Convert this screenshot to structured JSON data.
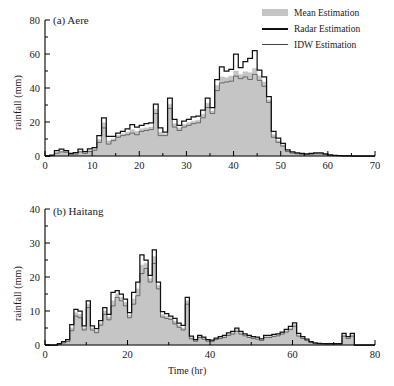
{
  "figure": {
    "background": "#ffffff",
    "fill_color": "#c5c5c5",
    "radar_color": "#111111",
    "idw_color": "#444444"
  },
  "legend": {
    "position": "top-right",
    "entries": [
      {
        "label": "Mean Estimation",
        "mark": "fill-swatch"
      },
      {
        "label": "Radar Estimation",
        "mark": "thick-line"
      },
      {
        "label": "IDW Estimation",
        "mark": "thin-line"
      }
    ]
  },
  "chart_data": [
    {
      "type": "area",
      "panel": "a",
      "title": "(a) Aere",
      "xlabel": "",
      "ylabel": "rainfall (mm)",
      "xlim": [
        0,
        70
      ],
      "ylim": [
        0,
        80
      ],
      "xticks": [
        0,
        10,
        20,
        30,
        40,
        50,
        60,
        70
      ],
      "yticks": [
        0,
        20,
        40,
        60,
        80
      ],
      "xminor_step": 5,
      "yminor_step": 10,
      "grid": false,
      "x": [
        0,
        1,
        2,
        3,
        4,
        5,
        6,
        7,
        8,
        9,
        10,
        11,
        12,
        13,
        14,
        15,
        16,
        17,
        18,
        19,
        20,
        21,
        22,
        23,
        24,
        25,
        26,
        27,
        28,
        29,
        30,
        31,
        32,
        33,
        34,
        35,
        36,
        37,
        38,
        39,
        40,
        41,
        42,
        43,
        44,
        45,
        46,
        47,
        48,
        49,
        50,
        51,
        52,
        53,
        54,
        55,
        56,
        57,
        58,
        59,
        60,
        61,
        62,
        63,
        64,
        65,
        66,
        67,
        68,
        69,
        70
      ],
      "series": [
        {
          "name": "Mean Estimation",
          "values": [
            0,
            0.3,
            2.2,
            3.0,
            2.6,
            1.2,
            1.5,
            3.0,
            2.0,
            3.3,
            4.2,
            9.6,
            19.5,
            9.0,
            10.0,
            12.0,
            13.0,
            14.0,
            15.5,
            14.5,
            16.0,
            16.5,
            17.0,
            27.5,
            14.0,
            13.0,
            30.5,
            19.0,
            16.5,
            18.5,
            19.5,
            20.5,
            21.0,
            24.5,
            31.0,
            26.5,
            41.5,
            46.5,
            46.0,
            47.0,
            50.0,
            48.0,
            49.5,
            49.0,
            51.5,
            47.0,
            43.5,
            33.0,
            12.5,
            9.0,
            6.5,
            3.0,
            2.0,
            1.5,
            1.2,
            1.0,
            1.2,
            1.5,
            1.5,
            1.0,
            0.5,
            0.3,
            0.2,
            0.1,
            0.1,
            0,
            0,
            0,
            0,
            0,
            0
          ]
        },
        {
          "name": "Radar Estimation",
          "values": [
            0,
            0.5,
            3.2,
            4.0,
            3.2,
            1.6,
            2.0,
            4.0,
            2.6,
            4.2,
            5.0,
            12.0,
            22.5,
            11.5,
            11.5,
            13.5,
            14.5,
            16.0,
            18.5,
            17.0,
            18.0,
            19.0,
            19.5,
            30.5,
            16.5,
            14.0,
            34.0,
            21.5,
            18.0,
            20.5,
            21.5,
            23.0,
            23.5,
            27.0,
            34.0,
            28.5,
            45.0,
            52.5,
            50.0,
            51.0,
            60.0,
            52.0,
            55.5,
            57.5,
            62.0,
            50.5,
            46.5,
            35.0,
            14.5,
            10.5,
            7.5,
            3.6,
            2.4,
            1.8,
            1.5,
            1.2,
            1.5,
            1.8,
            1.8,
            1.2,
            0.6,
            0.4,
            0.2,
            0.1,
            0.1,
            0,
            0,
            0,
            0,
            0,
            0
          ]
        },
        {
          "name": "IDW Estimation",
          "values": [
            0,
            0.2,
            1.6,
            2.4,
            2.2,
            0.9,
            1.1,
            2.4,
            1.5,
            2.6,
            3.4,
            8.0,
            16.5,
            7.0,
            9.0,
            11.0,
            12.0,
            12.5,
            13.5,
            12.5,
            14.5,
            15.0,
            15.5,
            25.0,
            12.0,
            12.0,
            28.0,
            17.0,
            15.0,
            17.0,
            18.0,
            19.0,
            19.5,
            22.5,
            28.5,
            25.0,
            38.5,
            43.0,
            43.5,
            44.0,
            47.0,
            45.5,
            46.5,
            45.0,
            48.0,
            44.5,
            41.0,
            31.5,
            11.0,
            8.0,
            5.8,
            2.6,
            1.7,
            1.3,
            1.0,
            0.9,
            1.0,
            1.3,
            1.3,
            0.9,
            0.4,
            0.2,
            0.2,
            0.1,
            0.1,
            0,
            0,
            0,
            0,
            0,
            0
          ]
        }
      ]
    },
    {
      "type": "area",
      "panel": "b",
      "title": "(b) Haitang",
      "xlabel": "Time (hr)",
      "ylabel": "rainfall (mm)",
      "xlim": [
        0,
        80
      ],
      "ylim": [
        0,
        40
      ],
      "xticks": [
        0,
        20,
        40,
        60,
        80
      ],
      "yticks": [
        0,
        10,
        20,
        30,
        40
      ],
      "xminor_step": 10,
      "yminor_step": 5,
      "grid": false,
      "x": [
        0,
        1,
        2,
        3,
        4,
        5,
        6,
        7,
        8,
        9,
        10,
        11,
        12,
        13,
        14,
        15,
        16,
        17,
        18,
        19,
        20,
        21,
        22,
        23,
        24,
        25,
        26,
        27,
        28,
        29,
        30,
        31,
        32,
        33,
        34,
        35,
        36,
        37,
        38,
        39,
        40,
        41,
        42,
        43,
        44,
        45,
        46,
        47,
        48,
        49,
        50,
        51,
        52,
        53,
        54,
        55,
        56,
        57,
        58,
        59,
        60,
        61,
        62,
        63,
        64,
        65,
        66,
        67,
        68,
        69,
        70,
        71,
        72,
        73,
        74,
        75,
        76,
        77,
        78,
        79,
        80
      ],
      "series": [
        {
          "name": "Mean Estimation",
          "values": [
            0,
            0,
            0,
            0.3,
            0.8,
            1.3,
            5.0,
            9.5,
            9.0,
            5.0,
            12.0,
            5.0,
            4.2,
            6.5,
            10.0,
            8.2,
            13.0,
            15.0,
            14.0,
            12.5,
            8.8,
            13.5,
            16.5,
            23.5,
            24.0,
            19.5,
            26.0,
            17.5,
            9.0,
            8.5,
            8.0,
            7.0,
            5.8,
            5.0,
            13.0,
            2.2,
            1.3,
            2.5,
            2.0,
            1.3,
            1.2,
            1.8,
            2.2,
            2.5,
            3.2,
            3.6,
            4.5,
            3.6,
            3.0,
            2.5,
            2.2,
            2.0,
            1.5,
            2.5,
            2.5,
            2.8,
            3.0,
            3.5,
            4.2,
            5.0,
            6.0,
            3.0,
            2.2,
            1.5,
            0.8,
            0.5,
            0.4,
            0.3,
            0.3,
            0.3,
            0.3,
            0.3,
            3.0,
            2.2,
            3.0,
            0,
            0,
            0,
            0,
            0,
            0
          ]
        },
        {
          "name": "Radar Estimation",
          "values": [
            0,
            0,
            0,
            0.4,
            1.0,
            1.6,
            6.0,
            10.5,
            10.0,
            5.6,
            13.0,
            5.6,
            4.8,
            7.2,
            11.0,
            9.0,
            15.5,
            16.0,
            15.0,
            13.5,
            9.5,
            15.5,
            18.5,
            26.5,
            25.0,
            20.5,
            28.0,
            18.5,
            9.8,
            9.2,
            8.5,
            7.8,
            6.4,
            5.8,
            14.0,
            2.6,
            1.6,
            2.8,
            2.3,
            1.6,
            1.4,
            2.0,
            2.5,
            2.8,
            3.6,
            4.0,
            5.0,
            4.0,
            3.3,
            2.8,
            2.5,
            2.3,
            1.8,
            2.8,
            2.8,
            3.1,
            3.3,
            3.8,
            4.6,
            5.5,
            6.5,
            3.4,
            2.5,
            1.7,
            1.0,
            0.6,
            0.5,
            0.4,
            0.4,
            0.4,
            0.4,
            0.4,
            3.4,
            2.5,
            3.4,
            0,
            0,
            0,
            0,
            0,
            0
          ]
        },
        {
          "name": "IDW Estimation",
          "values": [
            0,
            0,
            0,
            0.2,
            0.6,
            1.0,
            4.2,
            8.5,
            8.0,
            4.4,
            11.0,
            4.4,
            3.6,
            5.8,
            9.0,
            7.4,
            11.5,
            14.0,
            13.0,
            11.5,
            8.0,
            12.0,
            14.5,
            21.0,
            22.5,
            18.5,
            24.0,
            16.5,
            8.2,
            7.8,
            7.5,
            6.2,
            5.2,
            4.4,
            12.0,
            1.8,
            1.1,
            2.2,
            1.7,
            1.1,
            1.0,
            1.6,
            1.9,
            2.2,
            2.8,
            3.2,
            4.0,
            3.2,
            2.7,
            2.2,
            1.9,
            1.7,
            1.3,
            2.2,
            2.2,
            2.5,
            2.7,
            3.2,
            3.8,
            4.5,
            5.5,
            2.6,
            1.9,
            1.3,
            0.7,
            0.4,
            0.3,
            0.3,
            0.2,
            0.2,
            0.2,
            0.2,
            2.6,
            1.9,
            2.6,
            0,
            0,
            0,
            0,
            0,
            0
          ]
        }
      ]
    }
  ]
}
